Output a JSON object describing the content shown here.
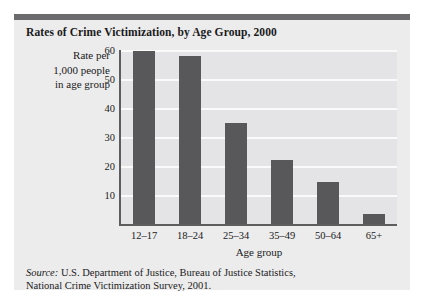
{
  "figure": {
    "title": "Rates of Crime Victimization, by Age Group, 2000",
    "source_word": "Source:",
    "source_line1": " U.S. Department of Justice, Bureau of Justice Statistics,",
    "source_line2": "National Crime Victimization Survey, 2001."
  },
  "axis_label": {
    "y_line1": "Rate per",
    "y_line2": "1,000 people",
    "y_line3": "in age group",
    "x": "Age group"
  },
  "colors": {
    "panel_background": "#ececed",
    "plot_background": "#e4e4e6",
    "bar_fill": "#58585a",
    "axis_line": "#5d5d60",
    "gridline": "#fafafa",
    "top_rule": "#6b6b6e",
    "text": "#1a1a1a"
  },
  "chart_data": {
    "type": "bar",
    "title": "Rates of Crime Victimization, by Age Group, 2000",
    "xlabel": "Age group",
    "ylabel": "Rate per 1,000 people in age group",
    "categories": [
      "12–17",
      "18–24",
      "25–34",
      "35–49",
      "50–64",
      "65+"
    ],
    "values": [
      59.5,
      58,
      35,
      22,
      14.5,
      3.5
    ],
    "ylim": [
      0,
      60
    ],
    "yticks": [
      10,
      20,
      30,
      40,
      50,
      60
    ],
    "ytick_labels": [
      "10",
      "20",
      "30",
      "40",
      "50",
      "60"
    ],
    "grid": true,
    "legend": false,
    "series_color": "#58585a"
  }
}
